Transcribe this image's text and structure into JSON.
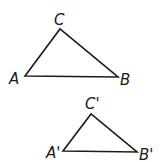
{
  "diagram": {
    "title": "",
    "stroke_color": "#1a1a1a",
    "triangles": [
      {
        "name": "ABC",
        "vertices": {
          "A": {
            "label": "A",
            "x": 25,
            "y": 76
          },
          "B": {
            "label": "B",
            "x": 118,
            "y": 77
          },
          "C": {
            "label": "C",
            "x": 60,
            "y": 29
          }
        }
      },
      {
        "name": "A'B'C'",
        "vertices": {
          "A": {
            "label": "A'",
            "x": 63,
            "y": 151
          },
          "B": {
            "label": "B'",
            "x": 137,
            "y": 152
          },
          "C": {
            "label": "C'",
            "x": 91,
            "y": 114
          }
        }
      }
    ]
  }
}
